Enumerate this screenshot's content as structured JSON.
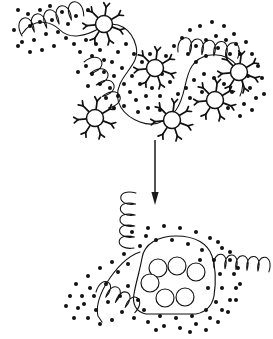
{
  "figure": {
    "background_color": "#ffffff",
    "ink_color": "#111111",
    "width": 273,
    "height": 339,
    "caption": "",
    "panels": [
      {
        "id": "top-panel",
        "name": "extended-state",
        "label": "",
        "description": "Extended meandering chain with coiled segments, radiating receptor clusters and scattered free particles"
      },
      {
        "id": "bottom-panel",
        "name": "collapsed-state",
        "label": "",
        "description": "Compacted aggregate with internalized beads enclosed by an outline, flanked by coils and surrounded by particles"
      }
    ]
  },
  "arrow": {
    "name": "transition-arrow",
    "label": "",
    "direction": "down",
    "x": 155,
    "y_start": 140,
    "y_end": 205,
    "color": "#1a1a1a"
  },
  "chart_data": {
    "type": "diagram",
    "xlabel": "",
    "ylabel": "",
    "legend": [],
    "annotations": [],
    "top_chain": {
      "name": "extended-chain",
      "path": "M 22 34 C 34 16 52 22 60 30 C 70 40 86 36 100 28 C 118 18 132 30 136 46 C 140 62 126 70 120 84 C 112 102 124 116 140 122 C 156 128 168 120 176 110 C 186 96 184 78 192 66 C 200 54 216 52 228 58 C 242 66 246 82 240 96",
      "stroke_width": 1.05
    },
    "top_coils": [
      {
        "name": "coil-upper-left",
        "x": 22,
        "y": 36,
        "loops": 5,
        "loop_w": 13,
        "loop_h": 22,
        "rotation": -18
      },
      {
        "name": "coil-mid-left",
        "x": 84,
        "y": 62,
        "loops": 4,
        "loop_w": 13,
        "loop_h": 21,
        "rotation": 62
      },
      {
        "name": "coil-upper-right",
        "x": 178,
        "y": 52,
        "loops": 5,
        "loop_w": 12,
        "loop_h": 20,
        "rotation": 6
      }
    ],
    "top_receptors": [
      {
        "name": "receptor-1",
        "cx": 104,
        "cy": 24,
        "r": 8.5,
        "spikes": 7
      },
      {
        "name": "receptor-2",
        "cx": 95,
        "cy": 118,
        "r": 8.5,
        "spikes": 7
      },
      {
        "name": "receptor-3",
        "cx": 155,
        "cy": 68,
        "r": 8.5,
        "spikes": 7
      },
      {
        "name": "receptor-4",
        "cx": 172,
        "cy": 120,
        "r": 8.5,
        "spikes": 7
      },
      {
        "name": "receptor-5",
        "cx": 215,
        "cy": 100,
        "r": 8.5,
        "spikes": 7
      },
      {
        "name": "receptor-6",
        "cx": 239,
        "cy": 72,
        "r": 8.5,
        "spikes": 7
      }
    ],
    "top_particles": [
      [
        18,
        10
      ],
      [
        28,
        14
      ],
      [
        40,
        10
      ],
      [
        50,
        6
      ],
      [
        62,
        12
      ],
      [
        40,
        22
      ],
      [
        52,
        20
      ],
      [
        30,
        26
      ],
      [
        14,
        30
      ],
      [
        22,
        42
      ],
      [
        34,
        40
      ],
      [
        46,
        34
      ],
      [
        58,
        32
      ],
      [
        68,
        24
      ],
      [
        76,
        16
      ],
      [
        88,
        10
      ],
      [
        66,
        38
      ],
      [
        54,
        46
      ],
      [
        42,
        50
      ],
      [
        30,
        52
      ],
      [
        18,
        46
      ],
      [
        74,
        44
      ],
      [
        86,
        40
      ],
      [
        96,
        44
      ],
      [
        80,
        52
      ],
      [
        92,
        56
      ],
      [
        100,
        50
      ],
      [
        104,
        60
      ],
      [
        86,
        66
      ],
      [
        78,
        72
      ],
      [
        92,
        74
      ],
      [
        104,
        72
      ],
      [
        112,
        62
      ],
      [
        118,
        52
      ],
      [
        126,
        44
      ],
      [
        114,
        76
      ],
      [
        122,
        68
      ],
      [
        100,
        84
      ],
      [
        88,
        86
      ],
      [
        110,
        88
      ],
      [
        124,
        84
      ],
      [
        132,
        76
      ],
      [
        118,
        96
      ],
      [
        106,
        98
      ],
      [
        130,
        92
      ],
      [
        140,
        84
      ],
      [
        136,
        100
      ],
      [
        124,
        106
      ],
      [
        114,
        108
      ],
      [
        146,
        96
      ],
      [
        152,
        88
      ],
      [
        160,
        96
      ],
      [
        148,
        108
      ],
      [
        160,
        110
      ],
      [
        138,
        112
      ],
      [
        150,
        54
      ],
      [
        142,
        62
      ],
      [
        134,
        54
      ],
      [
        166,
        56
      ],
      [
        174,
        46
      ],
      [
        182,
        38
      ],
      [
        190,
        30
      ],
      [
        200,
        26
      ],
      [
        212,
        22
      ],
      [
        224,
        26
      ],
      [
        234,
        34
      ],
      [
        246,
        42
      ],
      [
        252,
        54
      ],
      [
        258,
        66
      ],
      [
        248,
        76
      ],
      [
        236,
        44
      ],
      [
        226,
        40
      ],
      [
        216,
        36
      ],
      [
        206,
        40
      ],
      [
        196,
        46
      ],
      [
        188,
        54
      ],
      [
        196,
        62
      ],
      [
        206,
        56
      ],
      [
        218,
        48
      ],
      [
        230,
        54
      ],
      [
        240,
        54
      ],
      [
        250,
        88
      ],
      [
        256,
        98
      ],
      [
        244,
        104
      ],
      [
        232,
        92
      ],
      [
        224,
        84
      ],
      [
        214,
        78
      ],
      [
        204,
        74
      ],
      [
        194,
        80
      ],
      [
        186,
        88
      ],
      [
        178,
        94
      ],
      [
        190,
        98
      ],
      [
        202,
        92
      ],
      [
        228,
        108
      ],
      [
        240,
        116
      ],
      [
        252,
        110
      ],
      [
        262,
        78
      ],
      [
        264,
        94
      ],
      [
        170,
        82
      ],
      [
        162,
        74
      ]
    ],
    "bottom_chain": {
      "name": "collapsed-chain",
      "envelope": "M 140 252 C 128 256 116 268 106 284 C 98 298 96 308 98 316 L 102 322",
      "stroke_width": 1.15
    },
    "bottom_envelope": {
      "name": "aggregate-outline",
      "path": "M 142 258 C 144 244 158 236 176 236 C 196 236 208 244 212 256 C 216 268 216 282 214 296 C 212 306 206 312 196 314 L 146 314 C 136 312 132 304 134 294 C 136 282 140 270 142 258 Z"
    },
    "bottom_beads": [
      {
        "name": "bead-1",
        "cx": 158,
        "cy": 268,
        "r": 9
      },
      {
        "name": "bead-2",
        "cx": 177,
        "cy": 266,
        "r": 9
      },
      {
        "name": "bead-3",
        "cx": 196,
        "cy": 272,
        "r": 9
      },
      {
        "name": "bead-4",
        "cx": 150,
        "cy": 283,
        "r": 9
      },
      {
        "name": "bead-5",
        "cx": 165,
        "cy": 298,
        "r": 9
      },
      {
        "name": "bead-6",
        "cx": 185,
        "cy": 297,
        "r": 9
      }
    ],
    "bottom_coils": [
      {
        "name": "coil-bottom-top",
        "x": 134,
        "y": 248,
        "loops": 5,
        "loop_w": 11,
        "loop_h": 20,
        "rotation": -88
      },
      {
        "name": "coil-bottom-left",
        "x": 96,
        "y": 292,
        "loops": 4,
        "loop_w": 11,
        "loop_h": 19,
        "rotation": 28
      },
      {
        "name": "coil-bottom-right",
        "x": 214,
        "y": 268,
        "loops": 5,
        "loop_w": 11,
        "loop_h": 19,
        "rotation": 4
      }
    ],
    "bottom_particles": [
      [
        132,
        232
      ],
      [
        148,
        228
      ],
      [
        164,
        226
      ],
      [
        180,
        228
      ],
      [
        196,
        232
      ],
      [
        210,
        238
      ],
      [
        222,
        248
      ],
      [
        230,
        260
      ],
      [
        234,
        274
      ],
      [
        236,
        288
      ],
      [
        230,
        300
      ],
      [
        222,
        310
      ],
      [
        210,
        318
      ],
      [
        196,
        324
      ],
      [
        180,
        328
      ],
      [
        164,
        326
      ],
      [
        148,
        322
      ],
      [
        134,
        318
      ],
      [
        122,
        312
      ],
      [
        112,
        320
      ],
      [
        100,
        324
      ],
      [
        88,
        318
      ],
      [
        78,
        308
      ],
      [
        70,
        296
      ],
      [
        76,
        284
      ],
      [
        88,
        276
      ],
      [
        100,
        268
      ],
      [
        112,
        262
      ],
      [
        124,
        254
      ],
      [
        118,
        272
      ],
      [
        106,
        284
      ],
      [
        94,
        296
      ],
      [
        84,
        304
      ],
      [
        96,
        310
      ],
      [
        108,
        302
      ],
      [
        120,
        296
      ],
      [
        128,
        286
      ],
      [
        140,
        246
      ],
      [
        156,
        240
      ],
      [
        172,
        240
      ],
      [
        188,
        244
      ],
      [
        202,
        250
      ],
      [
        214,
        260
      ],
      [
        220,
        274
      ],
      [
        222,
        288
      ],
      [
        216,
        302
      ],
      [
        206,
        310
      ],
      [
        192,
        316
      ],
      [
        176,
        318
      ],
      [
        160,
        316
      ],
      [
        144,
        310
      ],
      [
        138,
        300
      ],
      [
        200,
        260
      ],
      [
        208,
        288
      ],
      [
        128,
        264
      ],
      [
        146,
        236
      ],
      [
        90,
        288
      ],
      [
        82,
        296
      ],
      [
        66,
        306
      ],
      [
        74,
        318
      ],
      [
        156,
        330
      ],
      [
        190,
        332
      ],
      [
        206,
        330
      ],
      [
        218,
        322
      ],
      [
        228,
        312
      ],
      [
        236,
        300
      ],
      [
        240,
        284
      ],
      [
        238,
        268
      ],
      [
        230,
        252
      ],
      [
        218,
        242
      ]
    ]
  }
}
